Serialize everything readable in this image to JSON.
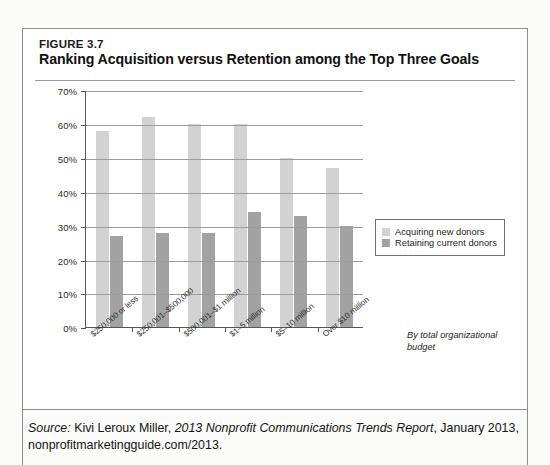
{
  "figure": {
    "number": "FIGURE 3.7",
    "title": "Ranking Acquisition versus Retention among the Top Three Goals"
  },
  "axis_note": "By total organizational budget",
  "source": {
    "label": "Source:",
    "author": " Kivi Leroux Miller, ",
    "report": "2013 Nonprofit Communications Trends Report",
    "rest": ", January 2013, nonprofitmarketingguide.com/2013."
  },
  "colors": {
    "acquiring": "#d2d2d2",
    "retaining": "#a2a2a2",
    "grid": "#9c9c9c",
    "axis": "#555555"
  },
  "chart_data": {
    "type": "bar",
    "title": "Ranking Acquisition versus Retention among the Top Three Goals",
    "xlabel": "By total organizational budget",
    "ylabel": "",
    "ylim": [
      0,
      70
    ],
    "ytick_labels": [
      "0%",
      "10%",
      "20%",
      "30%",
      "40%",
      "50%",
      "60%",
      "70%"
    ],
    "ytick_values": [
      0,
      10,
      20,
      30,
      40,
      50,
      60,
      70
    ],
    "grid": true,
    "legend_position": "right",
    "categories": [
      "$250,000 or less",
      "$250,001–$500,000",
      "$500,001–$1 million",
      "$1–5 million",
      "$5–10 million",
      "Over $10 million"
    ],
    "series": [
      {
        "name": "Acquiring new donors",
        "values": [
          58,
          62,
          60,
          60,
          50,
          47
        ]
      },
      {
        "name": "Retaining current donors",
        "values": [
          27,
          28,
          28,
          34,
          33,
          30
        ]
      }
    ]
  }
}
